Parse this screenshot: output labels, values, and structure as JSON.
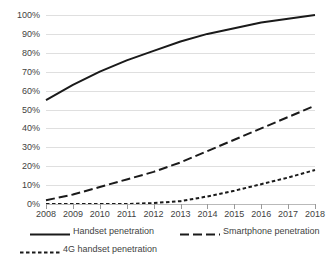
{
  "chart_data": {
    "type": "line",
    "title": "",
    "xlabel": "",
    "ylabel": "",
    "x": [
      2008,
      2009,
      2010,
      2011,
      2012,
      2013,
      2014,
      2015,
      2016,
      2017,
      2018
    ],
    "categories": [
      "2008",
      "2009",
      "2010",
      "2011",
      "2012",
      "2013",
      "2014",
      "2015",
      "2016",
      "2017",
      "2018"
    ],
    "xlim": [
      2008,
      2018
    ],
    "ylim": [
      0,
      100
    ],
    "ytick_labels": [
      "100%",
      "90%",
      "80%",
      "70%",
      "60%",
      "50%",
      "40%",
      "30%",
      "20%",
      "10%",
      "0%"
    ],
    "ytick_values": [
      100,
      90,
      80,
      70,
      60,
      50,
      40,
      30,
      20,
      10,
      0
    ],
    "grid": true,
    "grid_axis": "y",
    "legend_position": "bottom",
    "series": [
      {
        "name": "Handset penetration",
        "style": "solid",
        "color": "#1a1a1a",
        "values": [
          55,
          63,
          70,
          76,
          81,
          86,
          90,
          93,
          96,
          98,
          100
        ]
      },
      {
        "name": "Smartphone penetration",
        "style": "long-dash",
        "color": "#1a1a1a",
        "values": [
          2,
          5,
          9,
          13,
          17,
          22,
          28,
          34,
          40,
          46,
          52
        ]
      },
      {
        "name": "4G handset penetration",
        "style": "short-dash",
        "color": "#1a1a1a",
        "values": [
          0,
          0,
          0,
          0,
          0.5,
          1.5,
          4,
          7,
          10.5,
          14,
          18
        ]
      }
    ]
  },
  "legend": {
    "items": [
      {
        "label": "Handset penetration",
        "style": "solid"
      },
      {
        "label": "Smartphone penetration",
        "style": "long-dash"
      },
      {
        "label": "4G handset penetration",
        "style": "short-dash"
      }
    ]
  },
  "axes": {
    "grid_color": "#dfdfdf",
    "axis_color": "#b9b9b9",
    "tick_color": "#9a9a9a",
    "text_color": "#3f3f3f"
  }
}
